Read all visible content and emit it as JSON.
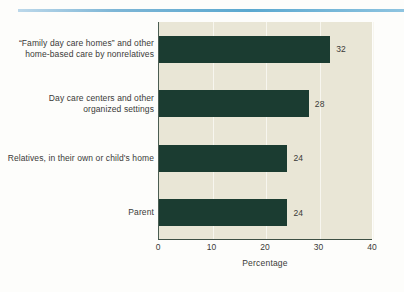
{
  "figure": {
    "background_color": "#fdfdfb",
    "plot_background_color": "#e9e6d6",
    "bar_color": "#1b3c31",
    "gridline_color": "#f7f6ef",
    "rule_color": "#5aa8cf"
  },
  "chart_data": {
    "type": "bar",
    "orientation": "horizontal",
    "title": "",
    "subtitle": "",
    "xlabel": "Percentage",
    "ylabel": "",
    "xlim": [
      0,
      40
    ],
    "xticks": [
      0,
      10,
      20,
      30,
      40
    ],
    "xtick_labels": [
      "0",
      "10",
      "20",
      "30",
      "40"
    ],
    "grid": true,
    "grid_axis": "x",
    "legend": false,
    "categories": [
      "“Family day care homes” and other home-based care by nonrelatives",
      "Day care centers and other organized settings",
      "Relatives, in their own or child's home",
      "Parent"
    ],
    "category_lines": [
      [
        "“Family day care homes” and other",
        "home-based care by nonrelatives"
      ],
      [
        "Day care centers and other",
        "organized settings"
      ],
      [
        "Relatives, in their own or child's home"
      ],
      [
        "Parent"
      ]
    ],
    "values": [
      32,
      28,
      24,
      24
    ],
    "data_labels": [
      "32",
      "28",
      "24",
      "24"
    ]
  }
}
